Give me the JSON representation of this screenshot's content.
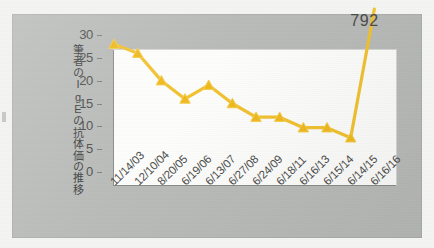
{
  "chart_data": {
    "type": "line",
    "title": "",
    "ylabel": "筆者のIgEの抗体価の推移",
    "xlabel": "",
    "ylim": [
      0,
      30
    ],
    "yticks": [
      0,
      5,
      10,
      15,
      20,
      25,
      30
    ],
    "grid": false,
    "legend": "none",
    "marker": "triangle",
    "series_color": "#F2C230",
    "categories": [
      "11/14/03",
      "12/10/04",
      "8/20/05",
      "6/19/06",
      "6/13/07",
      "6/27/08",
      "6/24/09",
      "6/18/11",
      "6/16/13",
      "6/15/14",
      "6/14/15",
      "6/16/16"
    ],
    "values": [
      28,
      26,
      20,
      16,
      19,
      15,
      12,
      12,
      9.7,
      9.7,
      7.5,
      792
    ],
    "annotations": [
      {
        "label": "792",
        "category": "6/16/16",
        "value": 792,
        "note": "off-scale final point"
      }
    ]
  },
  "axis": {
    "y_labels": [
      "30",
      "25",
      "20",
      "15",
      "10",
      "5",
      "0"
    ],
    "title_vertical": "筆者のIgEの抗体価の推移"
  }
}
